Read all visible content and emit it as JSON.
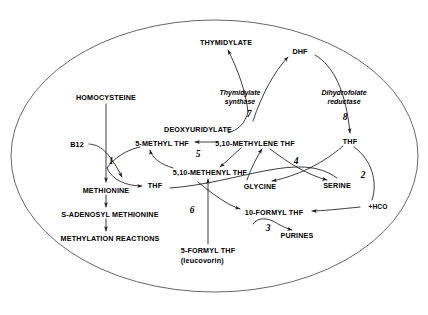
{
  "diagram": {
    "container_shape": "ellipse",
    "stroke_color": "#3a3a3a",
    "text_color": "#000000",
    "metabolites": [
      {
        "id": "homocysteine",
        "label": "HOMOCYSTEINE",
        "x": 106,
        "y": 97
      },
      {
        "id": "b12",
        "label": "B12",
        "x": 77,
        "y": 144
      },
      {
        "id": "methionine",
        "label": "METHIONINE",
        "x": 106,
        "y": 190
      },
      {
        "id": "sam",
        "label": "S-ADENOSYL METHIONINE",
        "x": 110,
        "y": 214
      },
      {
        "id": "methylation",
        "label": "METHYLATION REACTIONS",
        "x": 110,
        "y": 238
      },
      {
        "id": "thf-left",
        "label": "THF",
        "x": 155,
        "y": 185
      },
      {
        "id": "five-methyl-thf",
        "label": "5-METHYL THF",
        "x": 162,
        "y": 143
      },
      {
        "id": "deoxyuridylate",
        "label": "DEOXYURIDYLATE",
        "x": 198,
        "y": 129
      },
      {
        "id": "methylene-thf",
        "label": "5,10-METHYLENE THF",
        "x": 255,
        "y": 143
      },
      {
        "id": "methenyl-thf",
        "label": "5,10-METHENYL THF",
        "x": 210,
        "y": 172
      },
      {
        "id": "thymidylate",
        "label": "THYMIDYLATE",
        "x": 226,
        "y": 42
      },
      {
        "id": "dhf",
        "label": "DHF",
        "x": 300,
        "y": 51
      },
      {
        "id": "thf-right",
        "label": "THF",
        "x": 350,
        "y": 141
      },
      {
        "id": "glycine",
        "label": "GLYCINE",
        "x": 260,
        "y": 186
      },
      {
        "id": "serine",
        "label": "SERINE",
        "x": 337,
        "y": 185
      },
      {
        "id": "hco",
        "label": "+HCO",
        "x": 378,
        "y": 207
      },
      {
        "id": "ten-formyl-thf",
        "label": "10-FORMYL THF",
        "x": 274,
        "y": 212
      },
      {
        "id": "purines",
        "label": "PURINES",
        "x": 297,
        "y": 235
      },
      {
        "id": "five-formyl-thf",
        "label": "5-FORMYL THF",
        "x": 208,
        "y": 251,
        "sublabel": "(leucovorin)"
      }
    ],
    "enzymes": [
      {
        "id": "thymidylate-synthase",
        "line1": "Thymidylate",
        "line2": "synthase",
        "x": 240,
        "y": 97
      },
      {
        "id": "dihydrofolate-reductase",
        "line1": "Dihydrofolate",
        "line2": "reductase",
        "x": 344,
        "y": 97
      }
    ],
    "step_numbers": [
      {
        "id": "step-1",
        "label": "1",
        "x": 111,
        "y": 161
      },
      {
        "id": "step-2",
        "label": "2",
        "x": 363,
        "y": 175
      },
      {
        "id": "step-3",
        "label": "3",
        "x": 268,
        "y": 228
      },
      {
        "id": "step-4",
        "label": "4",
        "x": 296,
        "y": 161
      },
      {
        "id": "step-5",
        "label": "5",
        "x": 198,
        "y": 154
      },
      {
        "id": "step-6",
        "label": "6",
        "x": 192,
        "y": 210
      },
      {
        "id": "step-7",
        "label": "7",
        "x": 249,
        "y": 114
      },
      {
        "id": "step-8",
        "label": "8",
        "x": 345,
        "y": 117
      }
    ]
  }
}
